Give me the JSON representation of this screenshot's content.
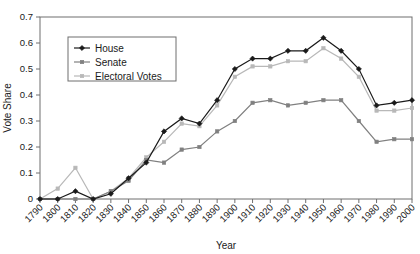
{
  "chart_data": {
    "type": "line",
    "title": "",
    "xlabel": "Year",
    "ylabel": "Vote Share",
    "xlim": [
      1790,
      2000
    ],
    "ylim": [
      0,
      0.7
    ],
    "grid": false,
    "legend_position": "upper-left-inside",
    "x": [
      1790,
      1800,
      1810,
      1820,
      1830,
      1840,
      1850,
      1860,
      1870,
      1880,
      1890,
      1900,
      1910,
      1920,
      1930,
      1940,
      1950,
      1960,
      1970,
      1980,
      1990,
      2000
    ],
    "xtick_labels": [
      "1790",
      "1800",
      "1810",
      "1820",
      "1830",
      "1840",
      "1850",
      "1860",
      "1870",
      "1880",
      "1890",
      "1900",
      "1910",
      "1920",
      "1930",
      "1940",
      "1950",
      "1960",
      "1970",
      "1980",
      "1990",
      "2000"
    ],
    "ytick_labels": [
      "0",
      "0.1",
      "0.2",
      "0.3",
      "0.4",
      "0.5",
      "0.6",
      "0.7"
    ],
    "ytick_values": [
      0,
      0.1,
      0.2,
      0.3,
      0.4,
      0.5,
      0.6,
      0.7
    ],
    "series": [
      {
        "name": "House",
        "color": "#1a1a1a",
        "marker": "diamond",
        "values": [
          0.0,
          0.0,
          0.03,
          0.0,
          0.02,
          0.08,
          0.14,
          0.26,
          0.31,
          0.29,
          0.38,
          0.5,
          0.54,
          0.54,
          0.57,
          0.57,
          0.62,
          0.57,
          0.5,
          0.36,
          0.37,
          0.38
        ]
      },
      {
        "name": "Senate",
        "color": "#808080",
        "marker": "square",
        "values": [
          0.0,
          0.0,
          0.0,
          0.0,
          0.03,
          0.07,
          0.15,
          0.14,
          0.19,
          0.2,
          0.26,
          0.3,
          0.37,
          0.38,
          0.36,
          0.37,
          0.38,
          0.38,
          0.3,
          0.22,
          0.23,
          0.23
        ]
      },
      {
        "name": "Electoral Votes",
        "color": "#b8b8b8",
        "marker": "square",
        "values": [
          0.0,
          0.04,
          0.12,
          0.0,
          0.03,
          0.08,
          0.16,
          0.22,
          0.29,
          0.28,
          0.36,
          0.47,
          0.51,
          0.51,
          0.53,
          0.53,
          0.58,
          0.54,
          0.47,
          0.34,
          0.34,
          0.35
        ]
      }
    ]
  },
  "legend": {
    "items": [
      {
        "label": "House"
      },
      {
        "label": "Senate"
      },
      {
        "label": "Electoral Votes"
      }
    ]
  }
}
